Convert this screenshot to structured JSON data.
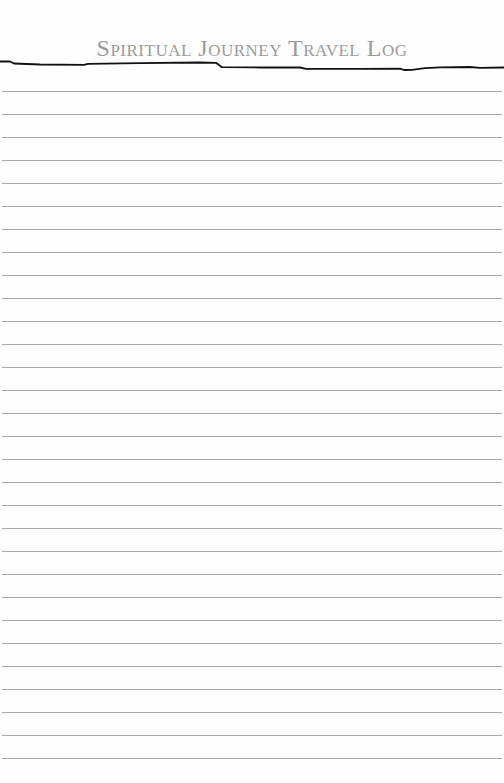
{
  "page": {
    "title": "Spiritual Journey Travel Log",
    "ruled_lines": {
      "count": 30,
      "first_y": 91,
      "spacing": 23,
      "color": "#a9a9a9"
    },
    "colors": {
      "title": "#9a9a9a",
      "header_rule": "#111111",
      "background": "#ffffff"
    }
  }
}
